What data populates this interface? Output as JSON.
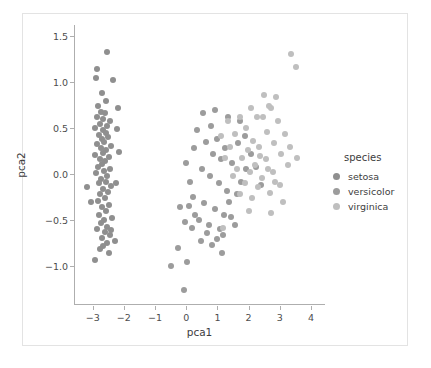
{
  "chart_data": {
    "type": "scatter",
    "title": "",
    "xlabel": "pca1",
    "ylabel": "pca2",
    "xlim": [
      -3.6,
      4.45
    ],
    "ylim": [
      -1.42,
      1.62
    ],
    "xticks": [
      -3,
      -2,
      -1,
      0,
      1,
      2,
      3,
      4
    ],
    "xticklabels": [
      "−3",
      "−2",
      "−1",
      "0",
      "1",
      "2",
      "3",
      "4"
    ],
    "yticks": [
      -1.0,
      -0.5,
      0.0,
      0.5,
      1.0,
      1.5
    ],
    "yticklabels": [
      "−1.0",
      "−0.5",
      "0.0",
      "0.5",
      "1.0",
      "1.5"
    ],
    "grid": false,
    "legend": {
      "title": "species",
      "position": "right",
      "entries": [
        "setosa",
        "versicolor",
        "virginica"
      ]
    },
    "marker_size": 6,
    "series": [
      {
        "name": "setosa",
        "color": "#8f8f8f",
        "points": [
          [
            -2.58,
            1.33
          ],
          [
            -2.91,
            1.14
          ],
          [
            -2.93,
            1.05
          ],
          [
            -2.72,
            0.88
          ],
          [
            -2.6,
            0.8
          ],
          [
            -2.85,
            0.74
          ],
          [
            -2.76,
            0.68
          ],
          [
            -2.63,
            0.66
          ],
          [
            -2.88,
            0.62
          ],
          [
            -2.69,
            0.6
          ],
          [
            -2.47,
            0.58
          ],
          [
            -2.8,
            0.55
          ],
          [
            -2.56,
            0.52
          ],
          [
            -2.95,
            0.5
          ],
          [
            -2.71,
            0.48
          ],
          [
            -2.62,
            0.45
          ],
          [
            -2.84,
            0.43
          ],
          [
            -2.53,
            0.4
          ],
          [
            -2.74,
            0.38
          ],
          [
            -2.66,
            0.35
          ],
          [
            -2.89,
            0.33
          ],
          [
            -2.45,
            0.31
          ],
          [
            -2.78,
            0.28
          ],
          [
            -2.59,
            0.26
          ],
          [
            -2.7,
            0.23
          ],
          [
            -2.97,
            0.21
          ],
          [
            -2.52,
            0.19
          ],
          [
            -2.81,
            0.16
          ],
          [
            -2.64,
            0.14
          ],
          [
            -2.73,
            0.11
          ],
          [
            -2.86,
            0.08
          ],
          [
            -2.49,
            0.06
          ],
          [
            -2.67,
            0.03
          ],
          [
            -2.92,
            0.01
          ],
          [
            -2.57,
            -0.02
          ],
          [
            -2.76,
            -0.05
          ],
          [
            -2.61,
            -0.08
          ],
          [
            -2.83,
            -0.1
          ],
          [
            -2.44,
            -0.13
          ],
          [
            -2.7,
            -0.16
          ],
          [
            -3.22,
            -0.14
          ],
          [
            -3.08,
            -0.3
          ],
          [
            -2.55,
            -0.19
          ],
          [
            -2.79,
            -0.22
          ],
          [
            -2.65,
            -0.26
          ],
          [
            -2.87,
            -0.29
          ],
          [
            -2.5,
            -0.33
          ],
          [
            -2.72,
            -0.36
          ],
          [
            -2.6,
            -0.4
          ],
          [
            -2.84,
            -0.44
          ],
          [
            -2.41,
            -0.47
          ],
          [
            -2.68,
            -0.5
          ],
          [
            -2.77,
            -0.53
          ],
          [
            -2.56,
            -0.57
          ],
          [
            -2.9,
            -0.6
          ],
          [
            -2.63,
            -0.63
          ],
          [
            -2.48,
            -0.66
          ],
          [
            -2.74,
            -0.69
          ],
          [
            -2.33,
            -0.72
          ],
          [
            -2.58,
            -0.75
          ],
          [
            -2.69,
            -0.78
          ],
          [
            -2.8,
            -0.81
          ],
          [
            -2.52,
            -0.85
          ],
          [
            -2.95,
            -0.93
          ],
          [
            -2.44,
            -0.61
          ],
          [
            -2.25,
            0.49
          ],
          [
            -2.3,
            -0.09
          ],
          [
            -2.21,
            0.72
          ],
          [
            -2.37,
            1.02
          ],
          [
            -2.18,
            0.24
          ]
        ]
      },
      {
        "name": "versicolor",
        "color": "#9c9c9c",
        "points": [
          [
            0.32,
            0.48
          ],
          [
            0.6,
            0.35
          ],
          [
            0.83,
            0.22
          ],
          [
            1.08,
            0.16
          ],
          [
            0.46,
            0.06
          ],
          [
            0.72,
            -0.02
          ],
          [
            1.02,
            -0.1
          ],
          [
            1.28,
            -0.18
          ],
          [
            0.18,
            -0.25
          ],
          [
            0.55,
            -0.31
          ],
          [
            0.9,
            -0.38
          ],
          [
            1.18,
            -0.44
          ],
          [
            0.38,
            -0.5
          ],
          [
            0.7,
            -0.55
          ],
          [
            1.05,
            -0.6
          ],
          [
            1.4,
            -0.46
          ],
          [
            0.05,
            -0.34
          ],
          [
            0.26,
            -0.44
          ],
          [
            0.62,
            -0.64
          ],
          [
            0.95,
            -0.7
          ],
          [
            -0.24,
            -0.36
          ],
          [
            -0.08,
            -0.52
          ],
          [
            0.14,
            -0.58
          ],
          [
            0.44,
            -0.72
          ],
          [
            0.8,
            -0.77
          ],
          [
            1.16,
            -0.66
          ],
          [
            1.52,
            -0.55
          ],
          [
            1.33,
            -0.3
          ],
          [
            1.58,
            -0.22
          ],
          [
            1.72,
            -0.08
          ],
          [
            1.9,
            0.06
          ],
          [
            1.44,
            0.12
          ],
          [
            1.2,
            0.28
          ],
          [
            0.96,
            0.38
          ],
          [
            0.75,
            0.52
          ],
          [
            1.62,
            0.34
          ],
          [
            1.85,
            0.42
          ],
          [
            2.04,
            0.22
          ],
          [
            2.2,
            0.08
          ],
          [
            2.35,
            -0.12
          ],
          [
            0.52,
            0.66
          ],
          [
            0.88,
            0.7
          ],
          [
            1.3,
            0.62
          ],
          [
            1.68,
            0.58
          ],
          [
            0.22,
            0.28
          ],
          [
            -0.05,
            0.12
          ],
          [
            0.08,
            -0.08
          ],
          [
            -0.3,
            -0.8
          ],
          [
            0.0,
            -0.95
          ],
          [
            -0.52,
            -1.0
          ],
          [
            -0.1,
            -1.26
          ],
          [
            1.1,
            -0.86
          ]
        ]
      },
      {
        "name": "virginica",
        "color": "#bfbfbf",
        "points": [
          [
            3.32,
            1.3
          ],
          [
            3.48,
            1.16
          ],
          [
            2.68,
            0.72
          ],
          [
            2.9,
            0.58
          ],
          [
            3.12,
            0.44
          ],
          [
            3.3,
            0.3
          ],
          [
            3.52,
            0.18
          ],
          [
            2.46,
            0.86
          ],
          [
            2.24,
            0.62
          ],
          [
            2.56,
            0.46
          ],
          [
            2.78,
            0.34
          ],
          [
            3.0,
            0.22
          ],
          [
            3.24,
            0.1
          ],
          [
            2.06,
            0.72
          ],
          [
            2.3,
            0.3
          ],
          [
            2.52,
            0.16
          ],
          [
            2.74,
            0.02
          ],
          [
            2.96,
            -0.12
          ],
          [
            1.88,
            0.5
          ],
          [
            2.12,
            0.36
          ],
          [
            2.34,
            0.2
          ],
          [
            2.58,
            0.06
          ],
          [
            2.82,
            -0.08
          ],
          [
            1.7,
            0.62
          ],
          [
            1.94,
            0.26
          ],
          [
            2.18,
            0.1
          ],
          [
            2.4,
            -0.04
          ],
          [
            2.66,
            -0.2
          ],
          [
            1.52,
            0.44
          ],
          [
            1.76,
            0.18
          ],
          [
            2.0,
            0.02
          ],
          [
            2.26,
            -0.14
          ],
          [
            1.36,
            0.3
          ],
          [
            1.6,
            0.06
          ],
          [
            1.84,
            -0.1
          ],
          [
            2.08,
            -0.26
          ],
          [
            1.22,
            0.18
          ],
          [
            1.46,
            -0.02
          ],
          [
            1.68,
            -0.22
          ],
          [
            1.98,
            -0.4
          ],
          [
            1.08,
            0.42
          ],
          [
            1.3,
            0.58
          ],
          [
            2.44,
            0.62
          ],
          [
            2.62,
            0.74
          ],
          [
            2.86,
            0.84
          ],
          [
            3.06,
            -0.3
          ],
          [
            2.7,
            -0.42
          ],
          [
            1.14,
            -0.58
          ]
        ]
      }
    ]
  }
}
